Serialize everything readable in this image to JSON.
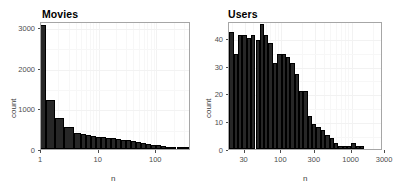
{
  "figure": {
    "layout": "two-panel-side-by-side",
    "background": "#ffffff",
    "panel_border_color": "#a6a6a6",
    "bar_fill": "#272727",
    "grid_color": "#f2f2f2"
  },
  "chart_data": [
    {
      "type": "bar",
      "title": "Movies",
      "xlabel": "n",
      "ylabel": "count",
      "xscale": "log10",
      "yscale": "linear",
      "grid": true,
      "legend": "none",
      "xlim": [
        1,
        400
      ],
      "ylim": [
        0,
        3150
      ],
      "xticks": [
        1,
        10,
        100
      ],
      "xtick_labels": [
        "1",
        "10",
        "100"
      ],
      "yticks": [
        0,
        1000,
        2000,
        3000
      ],
      "ytick_labels": [
        "0",
        "1000",
        "2000",
        "3000"
      ],
      "bin_centers_log": [
        1,
        1.45,
        2.1,
        3.05,
        4.4,
        5.4,
        6.6,
        8.1,
        9.9,
        12.1,
        14.8,
        18.1,
        22.1,
        27.1,
        33.1,
        40.5,
        49.5,
        60.6,
        74.1,
        90.6,
        110.8,
        135.5,
        165.7,
        202.7,
        247.9,
        303.2,
        370.7
      ],
      "values": [
        3060,
        1205,
        760,
        545,
        405,
        370,
        345,
        310,
        300,
        290,
        270,
        265,
        250,
        230,
        215,
        195,
        170,
        150,
        130,
        110,
        92,
        74,
        58,
        44,
        32,
        20,
        10
      ]
    },
    {
      "type": "bar",
      "title": "Users",
      "xlabel": "n",
      "ylabel": "count",
      "xscale": "log10",
      "yscale": "linear",
      "grid": true,
      "legend": "none",
      "xlim": [
        18,
        2800
      ],
      "ylim": [
        0,
        46
      ],
      "xticks": [
        30,
        100,
        300,
        1000,
        3000
      ],
      "xtick_labels": [
        "30",
        "100",
        "300",
        "1000",
        "3000"
      ],
      "yticks": [
        0,
        10,
        20,
        30,
        40
      ],
      "ytick_labels": [
        "0",
        "10",
        "20",
        "30",
        "40"
      ],
      "bin_centers_log": [
        19.5,
        22.5,
        26,
        30,
        34.5,
        40,
        46,
        53,
        61,
        70,
        81,
        94,
        108,
        125,
        144,
        166,
        192,
        221,
        255,
        294,
        340,
        392,
        452,
        522,
        602,
        695,
        802,
        925,
        1067,
        1231,
        1420,
        1639,
        1891,
        2182,
        2517
      ],
      "values": [
        42,
        34,
        41,
        41,
        40,
        41,
        39,
        45,
        41,
        38,
        31,
        34,
        34,
        33,
        31,
        27,
        21,
        21,
        12,
        9,
        8,
        7,
        5,
        4,
        2,
        1,
        1,
        1,
        2,
        1,
        1,
        0,
        0,
        0,
        0
      ]
    }
  ]
}
